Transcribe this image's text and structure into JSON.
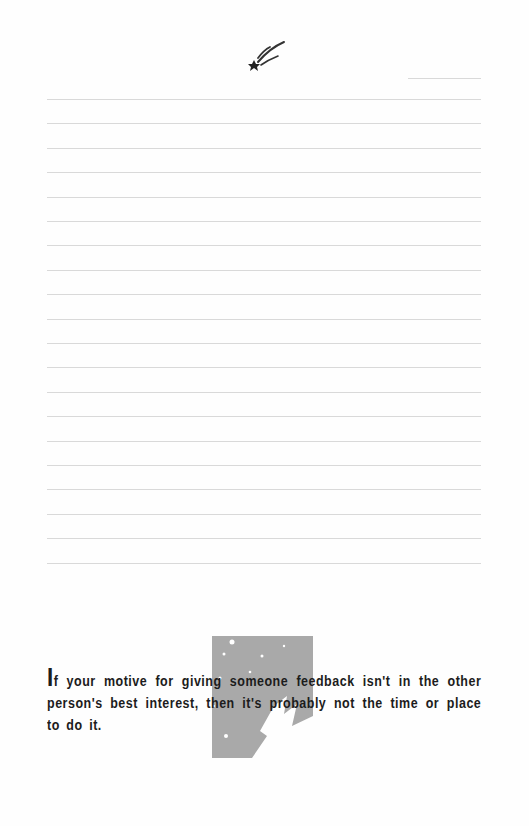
{
  "header": {
    "icon": "shooting-star-icon"
  },
  "lined_area": {
    "short_line": {
      "y": 78,
      "x1": 408,
      "x2": 481
    },
    "line_count": 20,
    "first_line_y": 99,
    "line_spacing": 24.4,
    "x1": 47,
    "x2": 481,
    "line_color": "#d9d9d9"
  },
  "illustration": {
    "name": "starry-night-graphic",
    "color": "#a9a9a9"
  },
  "quote": {
    "drop_cap": "I",
    "text": "f your motive for giving someone feedback isn't in the other person's best interest, then it's probably not the time or place to do it."
  }
}
